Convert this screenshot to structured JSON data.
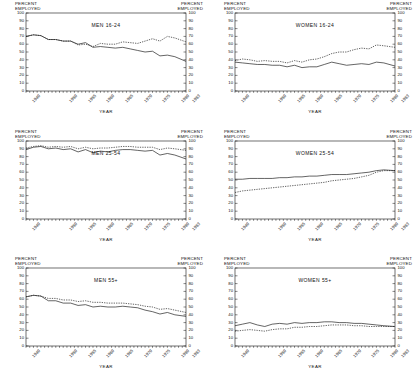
{
  "figure": {
    "axis_header_line1": "PERCENT",
    "axis_header_line2": "EMPLOYED",
    "xlabel": "YEAR",
    "y_ticks": [
      "0",
      "10",
      "20",
      "30",
      "40",
      "50",
      "60",
      "70",
      "80",
      "90",
      "100"
    ],
    "x_ticks": [
      "1940",
      "1950",
      "1955",
      "1960",
      "1965",
      "1970",
      "1975",
      "1980",
      "1983"
    ],
    "ink": "#111111"
  },
  "chart_data": [
    {
      "type": "line",
      "title": "MEN 16-24",
      "xlabel": "YEAR",
      "ylabel": "PERCENT EMPLOYED",
      "ylim": [
        0,
        100
      ],
      "xlim": [
        1940,
        1983
      ],
      "grid": false,
      "legend": "none",
      "x": [
        1940,
        1942,
        1944,
        1946,
        1948,
        1950,
        1952,
        1954,
        1956,
        1958,
        1960,
        1962,
        1964,
        1966,
        1968,
        1970,
        1972,
        1974,
        1976,
        1978,
        1980,
        1983
      ],
      "series": [
        {
          "name": "solid",
          "style": "solid",
          "values": [
            70,
            72,
            71,
            66,
            66,
            64,
            64,
            60,
            62,
            56,
            57,
            56,
            55,
            56,
            54,
            52,
            50,
            51,
            45,
            46,
            44,
            38
          ]
        },
        {
          "name": "dotted",
          "style": "dotted",
          "values": [
            70,
            72,
            71,
            66,
            66,
            64,
            64,
            59,
            60,
            57,
            61,
            60,
            60,
            63,
            62,
            61,
            64,
            67,
            64,
            70,
            68,
            63
          ]
        }
      ]
    },
    {
      "type": "line",
      "title": "WOMEN 16-24",
      "xlabel": "YEAR",
      "ylabel": "PERCENT EMPLOYED",
      "ylim": [
        0,
        100
      ],
      "xlim": [
        1940,
        1983
      ],
      "grid": false,
      "legend": "none",
      "x": [
        1940,
        1942,
        1944,
        1946,
        1948,
        1950,
        1952,
        1954,
        1956,
        1958,
        1960,
        1962,
        1964,
        1966,
        1968,
        1970,
        1972,
        1974,
        1976,
        1978,
        1980,
        1983
      ],
      "series": [
        {
          "name": "solid",
          "style": "solid",
          "values": [
            37,
            36,
            35,
            34,
            34,
            33,
            33,
            31,
            33,
            30,
            31,
            31,
            34,
            37,
            35,
            33,
            34,
            35,
            34,
            37,
            36,
            32
          ]
        },
        {
          "name": "dotted",
          "style": "dotted",
          "values": [
            39,
            41,
            40,
            38,
            39,
            38,
            38,
            36,
            39,
            37,
            40,
            41,
            44,
            48,
            50,
            50,
            53,
            55,
            54,
            59,
            58,
            56
          ]
        }
      ]
    },
    {
      "type": "line",
      "title": "MEN 25-54",
      "xlabel": "YEAR",
      "ylabel": "PERCENT EMPLOYED",
      "ylim": [
        0,
        100
      ],
      "xlim": [
        1940,
        1983
      ],
      "grid": false,
      "legend": "none",
      "x": [
        1940,
        1942,
        1944,
        1946,
        1948,
        1950,
        1952,
        1954,
        1956,
        1958,
        1960,
        1962,
        1964,
        1966,
        1968,
        1970,
        1972,
        1974,
        1976,
        1978,
        1980,
        1983
      ],
      "series": [
        {
          "name": "solid",
          "style": "solid",
          "values": [
            89,
            92,
            93,
            90,
            91,
            89,
            90,
            86,
            89,
            85,
            87,
            86,
            88,
            89,
            89,
            88,
            87,
            88,
            82,
            84,
            82,
            77
          ]
        },
        {
          "name": "dotted",
          "style": "dotted",
          "values": [
            91,
            93,
            94,
            92,
            93,
            92,
            93,
            90,
            92,
            90,
            91,
            91,
            92,
            93,
            93,
            92,
            92,
            92,
            89,
            91,
            90,
            88
          ]
        }
      ]
    },
    {
      "type": "line",
      "title": "WOMEN 25-54",
      "xlabel": "YEAR",
      "ylabel": "PERCENT EMPLOYED",
      "ylim": [
        0,
        100
      ],
      "xlim": [
        1940,
        1983
      ],
      "grid": false,
      "legend": "none",
      "x": [
        1940,
        1942,
        1944,
        1946,
        1948,
        1950,
        1952,
        1954,
        1956,
        1958,
        1960,
        1962,
        1964,
        1966,
        1968,
        1970,
        1972,
        1974,
        1976,
        1978,
        1980,
        1983
      ],
      "series": [
        {
          "name": "solid",
          "style": "solid",
          "values": [
            51,
            51,
            52,
            52,
            52,
            52,
            53,
            53,
            54,
            54,
            55,
            55,
            56,
            57,
            57,
            57,
            58,
            59,
            60,
            62,
            63,
            62
          ]
        },
        {
          "name": "dotted",
          "style": "dotted",
          "values": [
            34,
            36,
            37,
            38,
            39,
            40,
            41,
            42,
            43,
            44,
            45,
            46,
            47,
            49,
            50,
            51,
            52,
            54,
            56,
            60,
            62,
            62
          ]
        }
      ]
    },
    {
      "type": "line",
      "title": "MEN 55+",
      "xlabel": "YEAR",
      "ylabel": "PERCENT EMPLOYED",
      "ylim": [
        0,
        100
      ],
      "xlim": [
        1940,
        1983
      ],
      "grid": false,
      "legend": "none",
      "x": [
        1940,
        1942,
        1944,
        1946,
        1948,
        1950,
        1952,
        1954,
        1956,
        1958,
        1960,
        1962,
        1964,
        1966,
        1968,
        1970,
        1972,
        1974,
        1976,
        1978,
        1980,
        1983
      ],
      "series": [
        {
          "name": "solid",
          "style": "solid",
          "values": [
            63,
            65,
            64,
            58,
            58,
            55,
            55,
            52,
            53,
            50,
            51,
            50,
            50,
            51,
            50,
            49,
            46,
            44,
            41,
            43,
            40,
            38
          ]
        },
        {
          "name": "dotted",
          "style": "dotted",
          "values": [
            63,
            65,
            64,
            61,
            61,
            59,
            59,
            57,
            58,
            56,
            56,
            55,
            55,
            55,
            54,
            53,
            51,
            50,
            47,
            48,
            46,
            43
          ]
        }
      ]
    },
    {
      "type": "line",
      "title": "WOMEN 55+",
      "xlabel": "YEAR",
      "ylabel": "PERCENT EMPLOYED",
      "ylim": [
        0,
        100
      ],
      "xlim": [
        1940,
        1983
      ],
      "grid": false,
      "legend": "none",
      "x": [
        1940,
        1942,
        1944,
        1946,
        1948,
        1950,
        1952,
        1954,
        1956,
        1958,
        1960,
        1962,
        1964,
        1966,
        1968,
        1970,
        1972,
        1974,
        1976,
        1978,
        1980,
        1983
      ],
      "series": [
        {
          "name": "solid",
          "style": "solid",
          "values": [
            26,
            28,
            30,
            27,
            25,
            28,
            29,
            28,
            30,
            29,
            30,
            30,
            31,
            31,
            30,
            30,
            29,
            29,
            28,
            27,
            26,
            25
          ]
        },
        {
          "name": "dotted",
          "style": "dotted",
          "values": [
            19,
            20,
            21,
            20,
            19,
            21,
            22,
            22,
            24,
            24,
            25,
            25,
            26,
            27,
            27,
            27,
            26,
            26,
            25,
            25,
            25,
            25
          ]
        }
      ]
    }
  ]
}
